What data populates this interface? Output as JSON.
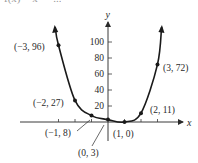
{
  "caption_clipped": "f(x) = x⁴ − ...",
  "chart_data": {
    "type": "line",
    "title": "",
    "xlabel": "x",
    "ylabel": "y",
    "grid": false,
    "legend": "none",
    "x_ticks": [
      -3,
      -2,
      -1,
      1,
      2,
      3
    ],
    "y_ticks": [
      20,
      40,
      60,
      80,
      100
    ],
    "y_tick_labels": [
      "20",
      "40",
      "60",
      "80",
      "100"
    ],
    "xlim": [
      -5.3,
      4.8
    ],
    "ylim": [
      -25,
      130
    ],
    "points": [
      {
        "x": -3,
        "y": 96,
        "label": "(−3, 96)"
      },
      {
        "x": -2,
        "y": 27,
        "label": "(−2, 27)"
      },
      {
        "x": -1,
        "y": 8,
        "label": "(−1, 8)"
      },
      {
        "x": 0,
        "y": 3,
        "label": "(0, 3)"
      },
      {
        "x": 1,
        "y": 0,
        "label": "(1, 0)"
      },
      {
        "x": 2,
        "y": 11,
        "label": "(2, 11)"
      },
      {
        "x": 3,
        "y": 72,
        "label": "(3, 72)"
      }
    ],
    "curve_color": "#1a1a1a",
    "axis_color": "#3a3a3a"
  },
  "layout": {
    "origin_px": [
      108,
      122
    ],
    "x_scale": 16.5,
    "y_scale": 0.8
  }
}
